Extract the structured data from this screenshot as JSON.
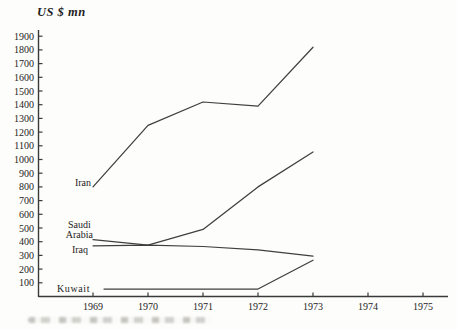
{
  "chart_data": {
    "type": "line",
    "title": "",
    "ylabel": "US $ mn",
    "xlabel": "",
    "grid": false,
    "legend_position": "inline-labels-at-line-starts",
    "ylim": [
      0,
      1950
    ],
    "y_axis_ticks": [
      1900,
      1800,
      1700,
      1600,
      1500,
      1400,
      1300,
      1200,
      1100,
      1000,
      900,
      800,
      700,
      600,
      500,
      400,
      300,
      200,
      100
    ],
    "x_axis_ticks": [
      "1969",
      "1970",
      "1971",
      "1972",
      "1973",
      "1974",
      "1975"
    ],
    "x": [
      1969,
      1970,
      1971,
      1972,
      1973
    ],
    "series": [
      {
        "name": "Iran",
        "values": [
          800,
          1250,
          1420,
          1390,
          1820
        ]
      },
      {
        "name": "Saudi Arabia",
        "values": [
          415,
          375,
          490,
          800,
          1055
        ]
      },
      {
        "name": "Iraq",
        "values": [
          370,
          375,
          365,
          340,
          295
        ]
      },
      {
        "name": "Kuwait",
        "values": [
          55,
          55,
          55,
          55,
          265
        ]
      }
    ],
    "line_color": "#3f3f3f",
    "axis_color": "#3a3a3a",
    "text_color": "#242424",
    "background_color": "#fdfdfb"
  }
}
